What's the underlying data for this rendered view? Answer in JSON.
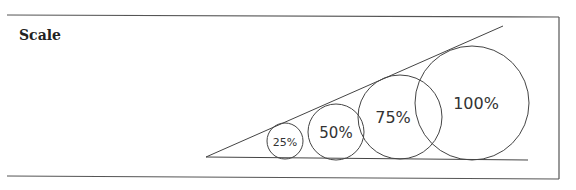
{
  "title": "Scale",
  "circles": [
    {
      "label": "25%"
    },
    {
      "label": "50%"
    },
    {
      "label": "75%"
    },
    {
      "label": "100%"
    }
  ]
}
